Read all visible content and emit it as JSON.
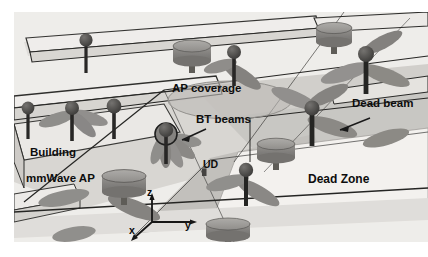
{
  "figure": {
    "type": "technical-illustration",
    "background_color": "#ffffff",
    "scene_color": "#f0efed"
  },
  "labels": {
    "ap_coverage": "AP coverage",
    "bt_beams": "BT beams",
    "dead_beam": "Dead beam",
    "building": "Building",
    "mmwave_ap": "mmWave AP",
    "ud": "UD",
    "dead_zone": "Dead Zone"
  },
  "axes": {
    "z": "z",
    "y": "y",
    "x": "x"
  },
  "colors": {
    "ground_light": "#eeece9",
    "ground_mid": "#d9d7d3",
    "ground_dark": "#c2c0bc",
    "building_face": "#e6e4e0",
    "building_top": "#efedea",
    "beam_lobe": "#8f8d8a",
    "beam_lobe_dark": "#75736f",
    "device_body": "#8d8b88",
    "device_dark": "#3a3937",
    "line": "#1a1a1a",
    "coverage_ellipse": "#b9b7b3",
    "label_text": "#0d0d0d"
  },
  "elements": {
    "mmwave_aps": [
      {
        "id": "ap-1",
        "x": 178,
        "y": 38,
        "kind": "cylinder-disk"
      },
      {
        "id": "ap-2",
        "x": 318,
        "y": 20,
        "kind": "cylinder-disk"
      },
      {
        "id": "ap-3",
        "x": 108,
        "y": 168,
        "kind": "cylinder-disk"
      },
      {
        "id": "ap-4",
        "x": 260,
        "y": 136,
        "kind": "cylinder-disk"
      },
      {
        "id": "ap-5",
        "x": 214,
        "y": 228,
        "kind": "cylinder-disk"
      }
    ],
    "drones": [
      {
        "id": "uav-1",
        "x": 72,
        "y": 30,
        "blades": 0
      },
      {
        "id": "uav-2",
        "x": 58,
        "y": 96,
        "blades": 4
      },
      {
        "id": "uav-3",
        "x": 100,
        "y": 96,
        "blades": 0
      },
      {
        "id": "uav-4",
        "x": 150,
        "y": 122,
        "blades": 5
      },
      {
        "id": "uav-5",
        "x": 218,
        "y": 40,
        "blades": 2
      },
      {
        "id": "uav-6",
        "x": 296,
        "y": 98,
        "blades": 4
      },
      {
        "id": "uav-7",
        "x": 352,
        "y": 44,
        "blades": 4
      },
      {
        "id": "uav-8",
        "x": 230,
        "y": 160,
        "blades": 3
      }
    ],
    "rooftop_antennas": [
      {
        "id": "ant-1",
        "x": 72,
        "y": 30
      },
      {
        "id": "ant-2",
        "x": 14,
        "y": 96
      },
      {
        "id": "ant-3",
        "x": 100,
        "y": 96
      }
    ],
    "annotation_arrows": [
      {
        "id": "arrow-bt-beams",
        "from": [
          196,
          120
        ],
        "to": [
          168,
          130
        ]
      },
      {
        "id": "arrow-dead-beam",
        "from": [
          352,
          110
        ],
        "to": [
          322,
          120
        ]
      },
      {
        "id": "arrow-ud",
        "from": [
          200,
          160
        ],
        "to": [
          196,
          158
        ]
      }
    ]
  }
}
